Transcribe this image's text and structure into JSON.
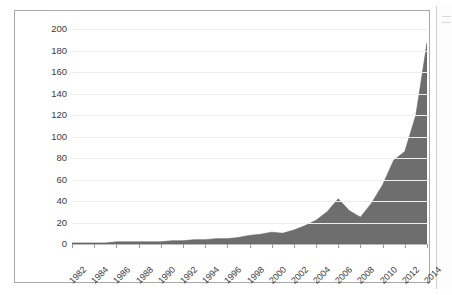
{
  "chart_data": {
    "type": "area",
    "title": "",
    "subtitle": "",
    "xlabel": "",
    "ylabel": "",
    "xlim": [
      1982,
      2014
    ],
    "ylim": [
      0,
      200
    ],
    "grid": true,
    "legend": false,
    "series_color": "#6e6e6e",
    "x": [
      1982,
      1983,
      1984,
      1985,
      1986,
      1987,
      1988,
      1989,
      1990,
      1991,
      1992,
      1993,
      1994,
      1995,
      1996,
      1997,
      1998,
      1999,
      2000,
      2001,
      2002,
      2003,
      2004,
      2005,
      2006,
      2007,
      2008,
      2009,
      2010,
      2011,
      2012,
      2013,
      2014
    ],
    "values": [
      1,
      1,
      1,
      1,
      2,
      2,
      2,
      2,
      2,
      3,
      3,
      4,
      4,
      5,
      5,
      6,
      8,
      9,
      11,
      10,
      13,
      17,
      22,
      30,
      42,
      31,
      25,
      38,
      55,
      78,
      86,
      120,
      187
    ],
    "y_ticks": [
      0,
      20,
      40,
      60,
      80,
      100,
      120,
      140,
      160,
      180,
      200
    ],
    "x_ticks": [
      1982,
      1984,
      1986,
      1988,
      1990,
      1992,
      1994,
      1996,
      1998,
      2000,
      2002,
      2004,
      2006,
      2008,
      2010,
      2012,
      2014
    ],
    "y_tick_labels": [
      "0",
      "20",
      "40",
      "60",
      "80",
      "100",
      "120",
      "140",
      "160",
      "180",
      "200"
    ],
    "x_tick_labels": [
      "1982",
      "1984",
      "1986",
      "1988",
      "1990",
      "1992",
      "1994",
      "1996",
      "1998",
      "2000",
      "2002",
      "2004",
      "2006",
      "2008",
      "2010",
      "2012",
      "2014"
    ]
  }
}
